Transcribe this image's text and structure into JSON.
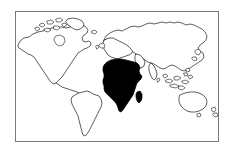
{
  "figure": {
    "kind": "world-map-outline-illustration",
    "title": "World map with Africa highlighted",
    "background_color": "#ffffff",
    "frame": {
      "visible": true,
      "color": "#7a7a7a",
      "x": 15,
      "y": 11,
      "width": 203,
      "height": 130
    },
    "outline_color": "#1a1a1a",
    "highlight_color": "#000000",
    "highlight_region": "Africa",
    "labels_visible": false,
    "regions": [
      {
        "name": "north-america",
        "highlighted": false,
        "fill": "#ffffff"
      },
      {
        "name": "greenland",
        "highlighted": false,
        "fill": "#ffffff"
      },
      {
        "name": "canadian-arctic-islands",
        "highlighted": false,
        "fill": "#ffffff"
      },
      {
        "name": "south-america",
        "highlighted": false,
        "fill": "#ffffff"
      },
      {
        "name": "europe",
        "highlighted": false,
        "fill": "#ffffff"
      },
      {
        "name": "asia",
        "highlighted": false,
        "fill": "#ffffff"
      },
      {
        "name": "british-isles",
        "highlighted": false,
        "fill": "#ffffff"
      },
      {
        "name": "japan",
        "highlighted": false,
        "fill": "#ffffff"
      },
      {
        "name": "indonesia",
        "highlighted": false,
        "fill": "#ffffff"
      },
      {
        "name": "australia",
        "highlighted": false,
        "fill": "#ffffff"
      },
      {
        "name": "new-zealand",
        "highlighted": false,
        "fill": "#ffffff"
      },
      {
        "name": "africa",
        "highlighted": true,
        "fill": "#000000"
      },
      {
        "name": "madagascar",
        "highlighted": true,
        "fill": "#000000"
      }
    ]
  }
}
